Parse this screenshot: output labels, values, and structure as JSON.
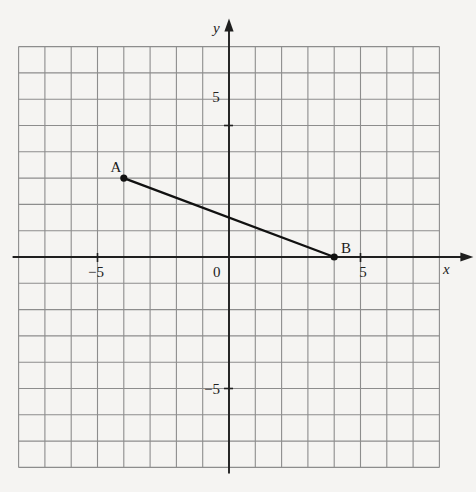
{
  "figure": {
    "kind": "coordinate-plane-diagram",
    "background_color": "#f5f4f2",
    "grid_color": "#8d8d8d",
    "axis_color": "#1f1f1f",
    "segment_color": "#111111"
  },
  "axes": {
    "x_label": "x",
    "y_label": "y",
    "origin_label": "0",
    "x_ticks": [
      {
        "value": -5,
        "label": "−5"
      },
      {
        "value": 5,
        "label": "5"
      }
    ],
    "y_ticks": [
      {
        "value": 5,
        "label": "5"
      },
      {
        "value": -5,
        "label": "−5"
      }
    ],
    "x_range": [
      -8,
      8
    ],
    "y_range": [
      -8,
      8
    ],
    "grid_step": 1,
    "grid_columns": 16,
    "grid_rows": 16
  },
  "chart_data": {
    "type": "scatter",
    "title": "",
    "xlabel": "x",
    "ylabel": "y",
    "xlim": [
      -8,
      8
    ],
    "ylim": [
      -8,
      8
    ],
    "grid": true,
    "points": [
      {
        "name": "A",
        "label": "A",
        "x": -4,
        "y": 3
      },
      {
        "name": "B",
        "label": "B",
        "x": 4,
        "y": 0
      }
    ],
    "segments": [
      {
        "name": "AB",
        "from": "A",
        "to": "B"
      }
    ]
  },
  "points": {
    "a": {
      "label": "A",
      "x": -4,
      "y": 3
    },
    "b": {
      "label": "B",
      "x": 4,
      "y": 0
    }
  }
}
